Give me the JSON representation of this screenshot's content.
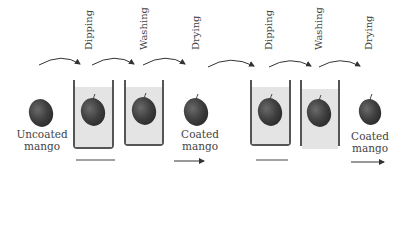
{
  "diagram": {
    "colors": {
      "mango": "#3e3e3e",
      "liquid": "#e4e4e4",
      "line": "#444444"
    },
    "sequences": [
      {
        "start_label_line1": "Uncoated",
        "start_label_line2": "mango",
        "steps": [
          "Dipping",
          "Washing",
          "Drying"
        ],
        "end_label_line1": "Coated",
        "end_label_line2": "mango"
      },
      {
        "steps": [
          "Dipping",
          "Washing",
          "Drying"
        ],
        "end_label_line1": "Coated",
        "end_label_line2": "mango"
      }
    ]
  }
}
